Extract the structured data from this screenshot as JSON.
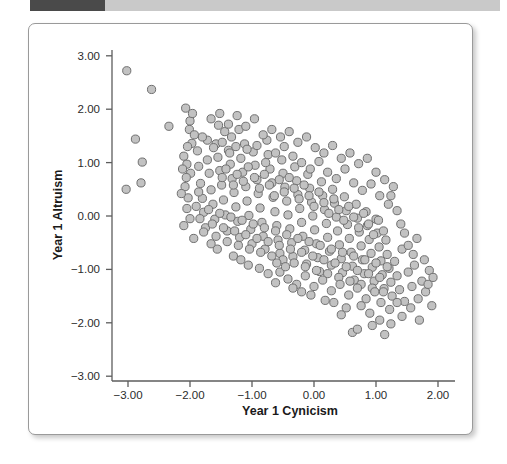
{
  "header": {
    "accent_color": "#4a4a4a",
    "bar_color": "#c9c9c9"
  },
  "chart_data": {
    "type": "scatter",
    "title": "",
    "xlabel": "Year 1 Cynicism",
    "ylabel": "Year 1 Altruism",
    "xlim": [
      -3.5,
      2.45
    ],
    "ylim": [
      -3.45,
      3.35
    ],
    "xticks": [
      -3.0,
      -2.0,
      -1.0,
      0.0,
      1.0,
      2.0
    ],
    "xticklabels": [
      "−3.00",
      "−2.00",
      "−1.00",
      "0.00",
      "1.00",
      "2.00"
    ],
    "yticks": [
      3.0,
      2.0,
      1.0,
      0.0,
      -1.0,
      -2.0,
      -3.0
    ],
    "yticklabels": [
      "3.00",
      "2.00",
      "1.00",
      "0.00",
      "−1.00",
      "−2.00",
      "−3.00"
    ],
    "grid": false,
    "legend": null,
    "marker": {
      "shape": "circle",
      "radius": 4.1,
      "fill": "#c2c2c2",
      "stroke": "#6f6f6f"
    },
    "n_points": 333,
    "correlation": "negative",
    "points": [
      [
        -3.02,
        2.72
      ],
      [
        -3.03,
        0.5
      ],
      [
        -2.88,
        1.44
      ],
      [
        -2.62,
        2.37
      ],
      [
        -2.77,
        1.01
      ],
      [
        -2.79,
        0.62
      ],
      [
        -2.34,
        1.68
      ],
      [
        -2.07,
        2.02
      ],
      [
        -2.01,
        1.62
      ],
      [
        -1.97,
        1.36
      ],
      [
        -2.04,
        1.3
      ],
      [
        -2.1,
        1.12
      ],
      [
        -2.05,
        0.97
      ],
      [
        -1.99,
        0.8
      ],
      [
        -2.08,
        0.55
      ],
      [
        -2.03,
        0.34
      ],
      [
        -2.05,
        0.14
      ],
      [
        -2.0,
        -0.05
      ],
      [
        -2.06,
        0.72
      ],
      [
        -1.93,
        1.52
      ],
      [
        -1.88,
        1.22
      ],
      [
        -1.86,
        0.93
      ],
      [
        -1.83,
        0.61
      ],
      [
        -1.8,
        0.33
      ],
      [
        -1.78,
        0.07
      ],
      [
        -1.75,
        -0.22
      ],
      [
        -1.72,
        1.05
      ],
      [
        -1.69,
        0.8
      ],
      [
        -1.66,
        0.49
      ],
      [
        -1.63,
        0.22
      ],
      [
        -1.6,
        -0.06
      ],
      [
        -1.58,
        1.35
      ],
      [
        -1.55,
        1.1
      ],
      [
        -1.52,
        0.85
      ],
      [
        -1.49,
        0.58
      ],
      [
        -1.46,
        0.3
      ],
      [
        -1.43,
        0.02
      ],
      [
        -1.4,
        -0.28
      ],
      [
        -1.38,
        1.23
      ],
      [
        -1.35,
        0.97
      ],
      [
        -1.32,
        0.7
      ],
      [
        -1.29,
        0.44
      ],
      [
        -1.26,
        0.17
      ],
      [
        -1.23,
        -0.1
      ],
      [
        -1.2,
        -0.4
      ],
      [
        -1.54,
        1.7
      ],
      [
        -1.44,
        1.58
      ],
      [
        -1.33,
        1.48
      ],
      [
        -1.21,
        1.62
      ],
      [
        -1.12,
        1.35
      ],
      [
        -1.18,
        1.08
      ],
      [
        -1.15,
        0.82
      ],
      [
        -1.1,
        0.55
      ],
      [
        -1.08,
        0.28
      ],
      [
        -1.05,
        0.01
      ],
      [
        -1.02,
        -0.25
      ],
      [
        -1.0,
        -0.52
      ],
      [
        -0.98,
        1.2
      ],
      [
        -0.95,
        0.95
      ],
      [
        -0.92,
        0.68
      ],
      [
        -0.9,
        0.42
      ],
      [
        -0.87,
        0.15
      ],
      [
        -0.84,
        -0.12
      ],
      [
        -0.82,
        -0.38
      ],
      [
        -0.79,
        -0.62
      ],
      [
        -0.76,
        1.42
      ],
      [
        -0.74,
        1.15
      ],
      [
        -0.71,
        0.88
      ],
      [
        -0.68,
        0.62
      ],
      [
        -0.66,
        0.35
      ],
      [
        -0.63,
        0.08
      ],
      [
        -0.6,
        -0.18
      ],
      [
        -0.58,
        -0.45
      ],
      [
        -0.55,
        -0.7
      ],
      [
        -0.52,
        1.05
      ],
      [
        -0.5,
        0.8
      ],
      [
        -0.47,
        0.54
      ],
      [
        -0.44,
        0.28
      ],
      [
        -0.42,
        0.02
      ],
      [
        -0.39,
        -0.24
      ],
      [
        -0.36,
        -0.5
      ],
      [
        -0.34,
        -0.76
      ],
      [
        -0.31,
        0.92
      ],
      [
        -0.28,
        0.66
      ],
      [
        -0.26,
        0.4
      ],
      [
        -0.23,
        0.14
      ],
      [
        -0.2,
        -0.12
      ],
      [
        -0.18,
        -0.38
      ],
      [
        -0.15,
        -0.64
      ],
      [
        -0.12,
        -0.9
      ],
      [
        -0.1,
        0.78
      ],
      [
        -0.07,
        0.52
      ],
      [
        -0.04,
        0.26
      ],
      [
        -0.02,
        0.0
      ],
      [
        0.01,
        -0.26
      ],
      [
        0.04,
        -0.52
      ],
      [
        0.06,
        -0.78
      ],
      [
        0.09,
        -1.04
      ],
      [
        0.12,
        0.64
      ],
      [
        0.14,
        0.38
      ],
      [
        0.17,
        0.12
      ],
      [
        0.2,
        -0.14
      ],
      [
        0.22,
        -0.4
      ],
      [
        0.25,
        -0.66
      ],
      [
        0.28,
        -0.92
      ],
      [
        0.3,
        0.5
      ],
      [
        0.33,
        0.24
      ],
      [
        0.36,
        -0.02
      ],
      [
        0.38,
        -0.28
      ],
      [
        0.41,
        -0.54
      ],
      [
        0.44,
        -0.8
      ],
      [
        0.46,
        -1.06
      ],
      [
        0.49,
        0.36
      ],
      [
        0.52,
        0.1
      ],
      [
        0.54,
        -0.16
      ],
      [
        0.57,
        -0.42
      ],
      [
        0.6,
        -0.68
      ],
      [
        0.62,
        -0.94
      ],
      [
        0.65,
        -1.2
      ],
      [
        0.68,
        0.22
      ],
      [
        0.7,
        -0.04
      ],
      [
        0.73,
        -0.3
      ],
      [
        0.76,
        -0.56
      ],
      [
        0.78,
        -0.82
      ],
      [
        0.81,
        -1.08
      ],
      [
        0.84,
        0.08
      ],
      [
        0.86,
        -0.18
      ],
      [
        0.89,
        -0.44
      ],
      [
        0.92,
        -0.7
      ],
      [
        0.94,
        -0.96
      ],
      [
        0.97,
        -1.22
      ],
      [
        1.0,
        -0.06
      ],
      [
        1.02,
        -0.32
      ],
      [
        1.05,
        -0.58
      ],
      [
        1.08,
        -0.84
      ],
      [
        1.1,
        -1.1
      ],
      [
        1.13,
        -1.36
      ],
      [
        1.16,
        -0.45
      ],
      [
        1.18,
        -0.72
      ],
      [
        1.21,
        -0.98
      ],
      [
        1.24,
        -1.24
      ],
      [
        1.26,
        -1.5
      ],
      [
        1.3,
        -0.85
      ],
      [
        1.34,
        -1.12
      ],
      [
        1.38,
        -1.38
      ],
      [
        1.42,
        -0.62
      ],
      [
        1.46,
        -1.6
      ],
      [
        1.52,
        -1.05
      ],
      [
        1.58,
        -1.32
      ],
      [
        1.62,
        -0.92
      ],
      [
        1.68,
        -1.55
      ],
      [
        1.74,
        -1.22
      ],
      [
        1.8,
        -1.42
      ],
      [
        1.86,
        -1.02
      ],
      [
        1.9,
        -1.68
      ],
      [
        -1.72,
        1.42
      ],
      [
        -1.62,
        1.28
      ],
      [
        -1.48,
        1.38
      ],
      [
        -1.36,
        1.18
      ],
      [
        -1.26,
        1.3
      ],
      [
        -1.08,
        1.25
      ],
      [
        -0.92,
        1.32
      ],
      [
        -0.78,
        1.0
      ],
      [
        -0.62,
        1.18
      ],
      [
        -0.48,
        1.3
      ],
      [
        -0.34,
        1.12
      ],
      [
        -0.2,
        1.0
      ],
      [
        -0.06,
        0.88
      ],
      [
        0.08,
        1.02
      ],
      [
        0.22,
        0.82
      ],
      [
        0.36,
        0.7
      ],
      [
        0.5,
        0.88
      ],
      [
        0.64,
        0.62
      ],
      [
        0.78,
        0.48
      ],
      [
        0.92,
        0.6
      ],
      [
        1.06,
        0.38
      ],
      [
        1.2,
        0.22
      ],
      [
        1.34,
        0.1
      ],
      [
        -1.9,
        0.18
      ],
      [
        -1.84,
        -0.05
      ],
      [
        -1.78,
        -0.3
      ],
      [
        -1.7,
        0.12
      ],
      [
        -1.64,
        -0.15
      ],
      [
        -1.58,
        -0.38
      ],
      [
        -1.52,
        0.05
      ],
      [
        -1.46,
        -0.22
      ],
      [
        -1.4,
        -0.48
      ],
      [
        -1.34,
        -0.02
      ],
      [
        -1.28,
        -0.28
      ],
      [
        -1.22,
        -0.55
      ],
      [
        -1.16,
        -0.08
      ],
      [
        -1.1,
        -0.35
      ],
      [
        -1.04,
        -0.62
      ],
      [
        -0.98,
        -0.15
      ],
      [
        -0.92,
        -0.42
      ],
      [
        -0.86,
        -0.68
      ],
      [
        -0.8,
        -0.22
      ],
      [
        -0.74,
        -0.48
      ],
      [
        -0.68,
        -0.75
      ],
      [
        -0.62,
        -0.28
      ],
      [
        -0.56,
        -0.55
      ],
      [
        -0.5,
        -0.82
      ],
      [
        -0.44,
        -0.35
      ],
      [
        -0.38,
        -0.62
      ],
      [
        -0.32,
        -0.88
      ],
      [
        -0.26,
        -0.42
      ],
      [
        -0.2,
        -0.68
      ],
      [
        -0.14,
        -0.95
      ],
      [
        -0.08,
        -0.48
      ],
      [
        -0.02,
        -0.75
      ],
      [
        0.04,
        -1.02
      ],
      [
        0.1,
        -0.55
      ],
      [
        0.16,
        -0.82
      ],
      [
        0.22,
        -1.08
      ],
      [
        0.28,
        -0.62
      ],
      [
        0.34,
        -0.88
      ],
      [
        0.4,
        -1.15
      ],
      [
        0.46,
        -0.68
      ],
      [
        0.52,
        -0.95
      ],
      [
        0.58,
        -1.22
      ],
      [
        0.64,
        -0.75
      ],
      [
        0.7,
        -1.02
      ],
      [
        0.76,
        -1.28
      ],
      [
        0.82,
        -0.82
      ],
      [
        0.88,
        -1.08
      ],
      [
        0.94,
        -1.35
      ],
      [
        1.0,
        -0.88
      ],
      [
        1.06,
        -1.15
      ],
      [
        1.12,
        -1.42
      ],
      [
        1.18,
        -0.95
      ],
      [
        -1.48,
        0.72
      ],
      [
        -1.42,
        0.88
      ],
      [
        -1.3,
        0.58
      ],
      [
        -1.24,
        0.78
      ],
      [
        -1.14,
        0.65
      ],
      [
        -1.06,
        0.92
      ],
      [
        -0.96,
        0.72
      ],
      [
        -0.88,
        0.52
      ],
      [
        -0.8,
        0.78
      ],
      [
        -0.72,
        0.58
      ],
      [
        -0.64,
        0.38
      ],
      [
        -0.56,
        0.68
      ],
      [
        -0.48,
        0.45
      ],
      [
        -0.4,
        0.72
      ],
      [
        -0.32,
        0.52
      ],
      [
        -0.24,
        0.32
      ],
      [
        -0.16,
        0.58
      ],
      [
        -0.08,
        0.38
      ],
      [
        0.0,
        0.18
      ],
      [
        0.08,
        0.45
      ],
      [
        0.16,
        0.25
      ],
      [
        0.24,
        0.05
      ],
      [
        0.32,
        0.32
      ],
      [
        0.4,
        0.12
      ],
      [
        0.48,
        -0.08
      ],
      [
        0.56,
        0.18
      ],
      [
        0.64,
        -0.02
      ],
      [
        0.72,
        -0.22
      ],
      [
        0.8,
        0.05
      ],
      [
        0.88,
        -0.15
      ],
      [
        0.96,
        -0.35
      ],
      [
        1.04,
        -0.08
      ],
      [
        1.12,
        -0.28
      ],
      [
        -0.55,
        -1.05
      ],
      [
        -0.42,
        -1.18
      ],
      [
        -0.28,
        -1.28
      ],
      [
        -0.14,
        -1.12
      ],
      [
        0.0,
        -1.32
      ],
      [
        0.14,
        -1.2
      ],
      [
        0.28,
        -1.4
      ],
      [
        0.42,
        -1.28
      ],
      [
        0.56,
        -1.48
      ],
      [
        0.7,
        -1.35
      ],
      [
        0.84,
        -1.55
      ],
      [
        0.98,
        -1.42
      ],
      [
        -0.88,
        -0.98
      ],
      [
        -0.74,
        -1.08
      ],
      [
        -0.6,
        -0.88
      ],
      [
        -0.46,
        -0.95
      ],
      [
        -1.3,
        -0.75
      ],
      [
        -1.18,
        -0.82
      ],
      [
        -1.06,
        -0.92
      ],
      [
        -1.56,
        -0.62
      ],
      [
        -1.66,
        -0.52
      ],
      [
        0.52,
        -1.72
      ],
      [
        0.76,
        -1.68
      ],
      [
        0.9,
        -1.82
      ],
      [
        1.08,
        -1.62
      ],
      [
        1.22,
        -1.75
      ],
      [
        1.42,
        -1.88
      ],
      [
        0.62,
        -2.18
      ],
      [
        0.94,
        -2.05
      ],
      [
        1.56,
        -1.72
      ],
      [
        1.7,
        -1.95
      ],
      [
        1.24,
        -2.02
      ],
      [
        -2.0,
        1.78
      ],
      [
        -1.96,
        1.92
      ],
      [
        -1.8,
        1.48
      ],
      [
        -1.66,
        1.82
      ],
      [
        -1.52,
        1.92
      ],
      [
        -1.38,
        1.72
      ],
      [
        -1.24,
        1.88
      ],
      [
        -1.1,
        1.68
      ],
      [
        -0.96,
        1.82
      ],
      [
        -0.82,
        1.52
      ],
      [
        -0.68,
        1.62
      ],
      [
        -0.54,
        1.48
      ],
      [
        -0.4,
        1.58
      ],
      [
        -0.26,
        1.38
      ],
      [
        -0.12,
        1.48
      ],
      [
        0.02,
        1.28
      ],
      [
        0.16,
        1.18
      ],
      [
        0.3,
        1.32
      ],
      [
        0.44,
        1.08
      ],
      [
        0.58,
        1.18
      ],
      [
        0.72,
        0.98
      ],
      [
        0.86,
        1.08
      ],
      [
        1.0,
        0.82
      ],
      [
        1.14,
        0.68
      ],
      [
        1.28,
        0.55
      ],
      [
        -2.12,
        0.88
      ],
      [
        -2.14,
        0.42
      ],
      [
        -2.1,
        -0.18
      ],
      [
        -1.94,
        -0.42
      ],
      [
        -1.86,
        0.45
      ],
      [
        1.46,
        -0.32
      ],
      [
        1.52,
        -0.55
      ],
      [
        1.6,
        -0.72
      ],
      [
        1.66,
        -0.42
      ],
      [
        1.34,
        -1.62
      ],
      [
        1.78,
        -0.82
      ],
      [
        1.84,
        -1.28
      ],
      [
        1.92,
        -1.15
      ],
      [
        1.4,
        -0.15
      ],
      [
        1.24,
        0.38
      ],
      [
        0.18,
        -1.58
      ],
      [
        0.32,
        -1.62
      ],
      [
        -0.05,
        -1.48
      ],
      [
        -0.2,
        -1.42
      ],
      [
        0.44,
        -1.85
      ],
      [
        -0.34,
        -1.35
      ],
      [
        1.06,
        -1.95
      ],
      [
        1.14,
        -2.22
      ],
      [
        0.7,
        -2.12
      ],
      [
        -0.62,
        -1.25
      ]
    ]
  },
  "figure": {
    "panel_background": "#ffffff",
    "border_color": "#9a9a9a"
  }
}
